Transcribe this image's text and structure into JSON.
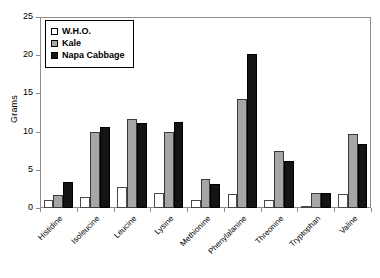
{
  "chart_data": {
    "type": "bar",
    "title": "",
    "subtitle": "",
    "xlabel": "",
    "ylabel": "Grams",
    "ylim": [
      0,
      25
    ],
    "yticks": [
      0,
      5,
      10,
      15,
      20,
      25
    ],
    "grid": false,
    "legend_position": "top-left",
    "categories": [
      "Histidine",
      "Isoleucine",
      "Leucine",
      "Lysine",
      "Methionine",
      "Phenylalanine",
      "Threonine",
      "Tryptophan",
      "Valine"
    ],
    "series": [
      {
        "name": "W.H.O.",
        "color": "#ffffff",
        "values": [
          1.0,
          1.5,
          2.7,
          2.0,
          1.0,
          1.8,
          1.1,
          0.3,
          1.8
        ]
      },
      {
        "name": "Kale",
        "color": "#a6a6a6",
        "values": [
          1.7,
          10.0,
          11.7,
          10.0,
          3.8,
          14.3,
          7.4,
          2.0,
          9.7
        ]
      },
      {
        "name": "Napa Cabbage",
        "color": "#141414",
        "values": [
          3.4,
          10.6,
          11.1,
          11.2,
          3.1,
          20.2,
          6.2,
          1.9,
          8.4
        ]
      }
    ]
  },
  "legend": {
    "items": [
      {
        "label": "W.H.O."
      },
      {
        "label": "Kale"
      },
      {
        "label": "Napa Cabbage"
      }
    ]
  },
  "axes": {
    "y_label": "Grams",
    "y_ticks": [
      "0",
      "5",
      "10",
      "15",
      "20",
      "25"
    ]
  }
}
